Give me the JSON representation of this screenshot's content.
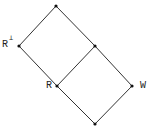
{
  "diagram": {
    "type": "lattice",
    "nodes": [
      {
        "id": "top",
        "x": 56,
        "y": 6,
        "label": ""
      },
      {
        "id": "r_perp",
        "x": 19,
        "y": 46,
        "label": "R",
        "superscript": "⊥"
      },
      {
        "id": "mid",
        "x": 95,
        "y": 46,
        "label": ""
      },
      {
        "id": "r",
        "x": 57,
        "y": 86,
        "label": "R"
      },
      {
        "id": "w",
        "x": 132,
        "y": 86,
        "label": "W"
      },
      {
        "id": "bottom",
        "x": 95,
        "y": 124,
        "label": ""
      }
    ],
    "edges": [
      [
        "top",
        "r_perp"
      ],
      [
        "top",
        "mid"
      ],
      [
        "r_perp",
        "r"
      ],
      [
        "mid",
        "r"
      ],
      [
        "mid",
        "w"
      ],
      [
        "r",
        "bottom"
      ],
      [
        "w",
        "bottom"
      ]
    ],
    "line_color": "#333333"
  }
}
